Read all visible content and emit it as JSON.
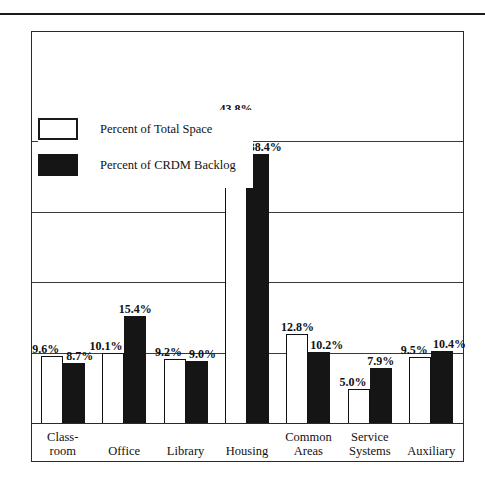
{
  "chart_data": {
    "type": "bar",
    "title": "",
    "subtitle": "",
    "xlabel": "",
    "ylabel": "",
    "ylim": [
      0,
      50
    ],
    "grid": true,
    "gridlines": [
      10,
      20,
      30,
      40
    ],
    "legend_position": "upper-left-inside",
    "categories": [
      "Class-\nroom",
      "Office",
      "Library",
      "Housing",
      "Common\nAreas",
      "Service\nSystems",
      "Auxiliary"
    ],
    "category_lines": [
      [
        "Class-",
        "room"
      ],
      [
        "Office"
      ],
      [
        "Library"
      ],
      [
        "Housing"
      ],
      [
        "Common",
        "Areas"
      ],
      [
        "Service",
        "Systems"
      ],
      [
        "Auxiliary"
      ]
    ],
    "series": [
      {
        "name": "Percent of Total Space",
        "style": "open",
        "values": [
          9.6,
          10.1,
          9.2,
          43.8,
          12.8,
          5.0,
          9.5
        ],
        "labels": [
          "9.6%",
          "10.1%",
          "9.2%",
          "43.8%",
          "12.8%",
          "5.0%",
          "9.5%"
        ]
      },
      {
        "name": "Percent of CRDM Backlog",
        "style": "filled",
        "values": [
          8.7,
          15.4,
          9.0,
          38.4,
          10.2,
          7.9,
          10.4
        ],
        "labels": [
          "8.7%",
          "15.4%",
          "9.0%",
          "38.4%",
          "10.2%",
          "7.9%",
          "10.4%"
        ]
      }
    ],
    "colors": {
      "open_fill": "#ffffff",
      "open_stroke": "#111111",
      "filled_fill": "#151515",
      "frame": "#2a2a2a",
      "gridline": "#3a3a3a",
      "text": "#111111",
      "background": "#ffffff"
    }
  },
  "legend": {
    "items": [
      {
        "label": "Percent of Total Space",
        "style": "open"
      },
      {
        "label": "Percent of CRDM Backlog",
        "style": "filled"
      }
    ]
  }
}
